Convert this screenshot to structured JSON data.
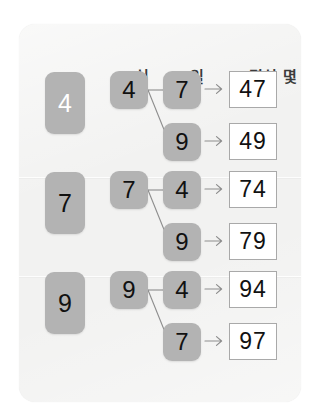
{
  "worksheet": {
    "headers": {
      "tens": "십",
      "ones": "일",
      "total": "몇십 몇"
    },
    "arrow_glyph": "right-arrow",
    "colors": {
      "card_background": "#f2f2f1",
      "tile_fill": "#b3b3b3",
      "tile_digit": "#111111",
      "tile_digit_light": "#ffffff",
      "answer_box_fill": "#ffffff",
      "answer_box_border": "#a9a9a9",
      "connector_line": "#8d8d8d",
      "header_text": "#3b3b3b"
    },
    "groups": [
      {
        "group_digit": "4",
        "group_digit_style": "light",
        "tens_digit": "4",
        "rows": [
          {
            "ones_digit": "7",
            "answer": "47"
          },
          {
            "ones_digit": "9",
            "answer": "49"
          }
        ]
      },
      {
        "group_digit": "7",
        "group_digit_style": "dark",
        "tens_digit": "7",
        "rows": [
          {
            "ones_digit": "4",
            "answer": "74"
          },
          {
            "ones_digit": "9",
            "answer": "79"
          }
        ]
      },
      {
        "group_digit": "9",
        "group_digit_style": "dark",
        "tens_digit": "9",
        "rows": [
          {
            "ones_digit": "4",
            "answer": "94"
          },
          {
            "ones_digit": "7",
            "answer": "97"
          }
        ]
      }
    ]
  }
}
